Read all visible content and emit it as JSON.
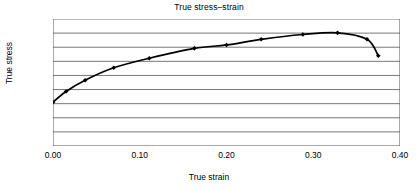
{
  "chart_data": {
    "type": "line",
    "title": "True stress–strain",
    "xlabel": "True strain",
    "ylabel": "True stress",
    "xlim": [
      0.0,
      0.4
    ],
    "ylim": [
      0,
      450
    ],
    "grid": true,
    "grid_axis": "y",
    "legend": null,
    "marker": "diamond",
    "line_color": "#000000",
    "marker_color": "#000000",
    "xticks": [
      0.0,
      0.1,
      0.2,
      0.3,
      0.4
    ],
    "xtick_labels": [
      "0.00",
      "0.10",
      "0.20",
      "0.30",
      "0.40"
    ],
    "yticks": [
      0,
      50,
      100,
      150,
      200,
      250,
      300,
      350,
      400,
      450
    ],
    "ytick_labels": [
      "0",
      "50",
      "100",
      "150",
      "200",
      "250",
      "300",
      "350",
      "400",
      "450"
    ],
    "x": [
      0.0,
      0.015,
      0.037,
      0.07,
      0.111,
      0.163,
      0.2,
      0.24,
      0.288,
      0.328,
      0.362,
      0.375
    ],
    "values": [
      155,
      193,
      233,
      277,
      311,
      346,
      358,
      378,
      395,
      401,
      378,
      320
    ],
    "series": [
      {
        "name": "True stress",
        "x": [
          0.0,
          0.015,
          0.037,
          0.07,
          0.111,
          0.163,
          0.2,
          0.24,
          0.288,
          0.328,
          0.362,
          0.375
        ],
        "values": [
          155,
          193,
          233,
          277,
          311,
          346,
          358,
          378,
          395,
          401,
          378,
          320
        ]
      }
    ]
  }
}
